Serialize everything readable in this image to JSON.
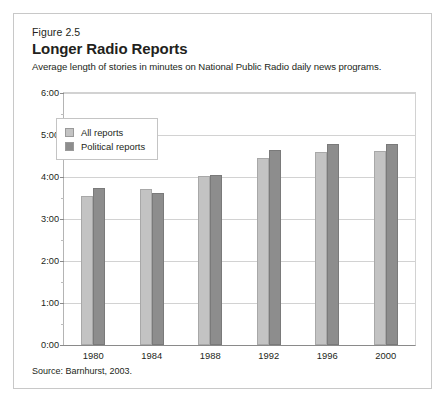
{
  "figure": {
    "number": "Figure 2.5",
    "title": "Longer Radio Reports",
    "subtitle": "Average length of stories in minutes on National Public Radio daily news programs.",
    "source": "Source: Barnhurst, 2003."
  },
  "colors": {
    "all_reports": "#c3c3c3",
    "political_reports": "#8d8d8d",
    "grid": "#d2d2d2",
    "axis": "#8a8a8a",
    "frame": "#c8c8c8",
    "text": "#231f20"
  },
  "chart_data": {
    "type": "bar",
    "title": "Longer Radio Reports",
    "subtitle": "Average length of stories in minutes on National Public Radio daily news programs.",
    "xlabel": "",
    "ylabel": "",
    "categories": [
      "1980",
      "1984",
      "1988",
      "1992",
      "1996",
      "2000"
    ],
    "series": [
      {
        "name": "All reports",
        "color": "#c3c3c3",
        "values": [
          3.55,
          3.72,
          4.03,
          4.45,
          4.6,
          4.62
        ],
        "value_labels": [
          "3:33",
          "3:43",
          "4:02",
          "4:27",
          "4:36",
          "4:37"
        ]
      },
      {
        "name": "Political reports",
        "color": "#8d8d8d",
        "values": [
          3.73,
          3.63,
          4.05,
          4.65,
          4.78,
          4.78
        ],
        "value_labels": [
          "3:44",
          "3:38",
          "4:03",
          "4:39",
          "4:47",
          "4:47"
        ]
      }
    ],
    "ylim": [
      0,
      6
    ],
    "ytick_values": [
      0,
      1,
      2,
      3,
      4,
      5,
      6
    ],
    "ytick_labels": [
      "0:00",
      "1:00",
      "2:00",
      "3:00",
      "4:00",
      "5:00",
      "6:00"
    ],
    "yminor_step": 0.5,
    "grid": true,
    "legend": {
      "position": "top-left",
      "entries": [
        "All reports",
        "Political reports"
      ]
    },
    "source": "Source: Barnhurst, 2003."
  }
}
